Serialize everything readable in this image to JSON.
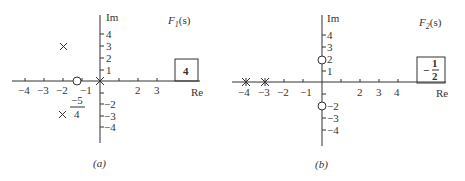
{
  "panels": [
    {
      "id": "a",
      "caption": "(a)",
      "function_label": "F",
      "function_sub": "1",
      "function_arg": "(s)",
      "gain": "4",
      "axis_re": "Re",
      "axis_im": "Im",
      "re_ticks": [
        "−4",
        "−3",
        "−2",
        "−1",
        "2",
        "3"
      ],
      "im_ticks_pos": [
        "4",
        "3",
        "2",
        "1"
      ],
      "im_ticks_neg": [
        "−2",
        "−3",
        "−4"
      ],
      "annotation_num": "−5",
      "annotation_den": "4",
      "poles": [
        {
          "re": -2,
          "im": 3
        },
        {
          "re": -2,
          "im": -3
        },
        {
          "re": 0,
          "im": 0
        }
      ],
      "zeros": [
        {
          "re": -1.25,
          "im": 0
        }
      ]
    },
    {
      "id": "b",
      "caption": "(b)",
      "function_label": "F",
      "function_sub": "2",
      "function_arg": "(s)",
      "gain_sign": "−",
      "gain_num": "1",
      "gain_den": "2",
      "axis_re": "Re",
      "axis_im": "Im",
      "re_ticks": [
        "−4",
        "−3",
        "−2",
        "−1",
        "2",
        "3",
        "4"
      ],
      "im_ticks_pos": [
        "4",
        "3",
        "2",
        "1"
      ],
      "im_ticks_neg": [
        "−2",
        "−3",
        "−4"
      ],
      "poles": [
        {
          "re": -4,
          "im": 0
        },
        {
          "re": -3,
          "im": 0
        }
      ],
      "zeros": [
        {
          "re": 0,
          "im": 2
        },
        {
          "re": 0,
          "im": -2
        }
      ]
    }
  ]
}
